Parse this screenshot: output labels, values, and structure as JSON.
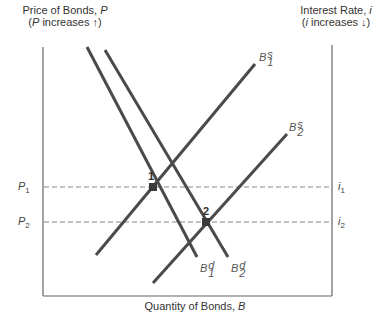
{
  "diagram": {
    "left_axis": {
      "title_line1_prefix": "Price of Bonds, ",
      "title_line1_var": "P",
      "title_line2_open": "(",
      "title_line2_var": "P",
      "title_line2_rest": " increases ↑)"
    },
    "right_axis": {
      "title_line1_prefix": "Interest Rate, ",
      "title_line1_var": "i",
      "title_line2_open": "(",
      "title_line2_var": "i",
      "title_line2_rest": " increases ↓)"
    },
    "x_axis": {
      "title_prefix": "Quantity of Bonds, ",
      "title_var": "B"
    },
    "levels": [
      {
        "left_var": "P",
        "left_sub": "1",
        "right_var": "i",
        "right_sub": "1"
      },
      {
        "left_var": "P",
        "left_sub": "2",
        "right_var": "i",
        "right_sub": "2"
      }
    ],
    "curves": {
      "supply1": {
        "var": "B",
        "sup": "s",
        "sub": "1"
      },
      "supply2": {
        "var": "B",
        "sup": "s",
        "sub": "2"
      },
      "demand1": {
        "var": "B",
        "sup": "d",
        "sub": "1"
      },
      "demand2": {
        "var": "B",
        "sup": "d",
        "sub": "2"
      }
    },
    "equilibria": [
      {
        "label": "1"
      },
      {
        "label": "2"
      }
    ],
    "colors": {
      "axis": "#666666",
      "curve": "#4a4a4a",
      "dashed": "#888888",
      "point": "#3a3a3a"
    }
  }
}
